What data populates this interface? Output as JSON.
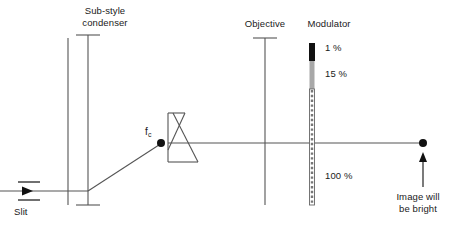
{
  "diagram": {
    "title_text_present": false,
    "labels": {
      "condenser": "Sub-style\ncondenser",
      "condenser_line1": "Sub-style",
      "condenser_line2": "condenser",
      "objective": "Objective",
      "modulator": "Modulator",
      "slit": "Slit",
      "focal_point": "f",
      "focal_point_sub": "c",
      "image_line1": "Image will",
      "image_line2": "be bright"
    },
    "modulator_zones": [
      {
        "name": "opaque-zone",
        "label": "1 %",
        "transmission": "1%",
        "color": "#111111"
      },
      {
        "name": "gray-zone",
        "label": "15 %",
        "transmission": "15%",
        "color": "#a8a8a8"
      },
      {
        "name": "clear-zone",
        "label": "100 %",
        "transmission": "100%",
        "color": "#ffffff"
      }
    ],
    "colors": {
      "line": "#555555",
      "dark_line": "#222222",
      "text": "#1a1a1a",
      "opaque": "#111111",
      "gray": "#a8a8a8",
      "clear": "#ffffff",
      "background": "#ffffff"
    },
    "optics": {
      "axis_y": 143,
      "slit_y": 191,
      "source_x": 68,
      "condenser_x": 88,
      "objective_x": 265,
      "modulator_x": 312,
      "image_point_x": 423
    }
  }
}
